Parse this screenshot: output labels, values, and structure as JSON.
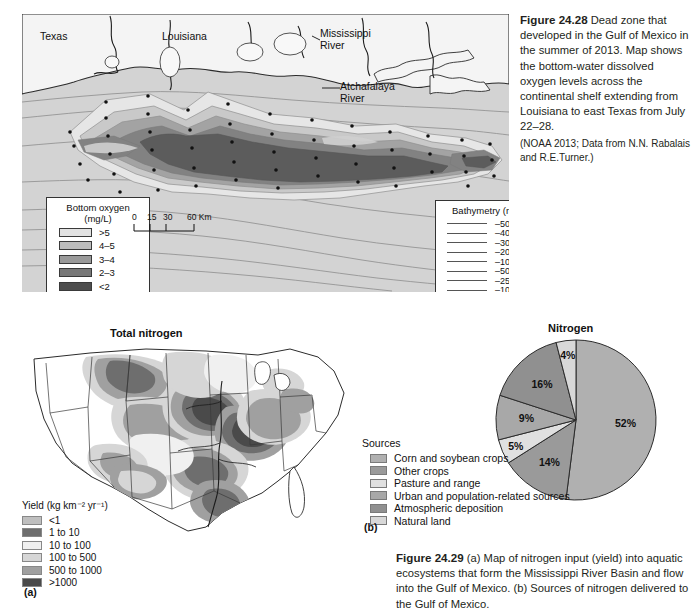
{
  "figure_2428": {
    "caption_number": "Figure 24.28",
    "caption_text": "Dead zone that developed in the Gulf of Mexico in the summer of 2013. Map shows the bottom-water dissolved oxygen levels across the continental shelf extending from Louisiana to east Texas from July 22–28.",
    "source": "(NOAA 2013; Data from N.N. Rabalais and R.E.Turner.)",
    "map_labels": {
      "texas": "Texas",
      "louisiana": "Louisiana",
      "mississippi_river": "Mississippi\nRiver",
      "atchafalaya_river": "Atchafalaya\nRiver"
    },
    "scale_bar": {
      "ticks": [
        "0",
        "15",
        "30",
        "60 Km"
      ]
    },
    "oxygen_legend": {
      "title_line1": "Bottom oxygen",
      "title_line2": "(mg/L)",
      "items": [
        {
          "label": ">5",
          "color": "#e2e2e2"
        },
        {
          "label": "4–5",
          "color": "#bdbdbd"
        },
        {
          "label": "3–4",
          "color": "#9a9a9a"
        },
        {
          "label": "2–3",
          "color": "#787878"
        },
        {
          "label": "<2",
          "color": "#4e4e4e"
        }
      ]
    },
    "bathymetry_legend": {
      "title": "Bathymetry (m)",
      "items": [
        "–500",
        "–400",
        "–300",
        "–200",
        "–100",
        "–50",
        "–25",
        "–10"
      ]
    }
  },
  "figure_2429": {
    "caption_number": "Figure 24.29",
    "caption_text": "(a) Map of nitrogen input (yield) into aquatic ecosystems that form the Mississippi River Basin and flow into the Gulf of Mexico. (b) Sources of nitrogen delivered to the Gulf of Mexico.",
    "source": "(United States Geological Survey.)",
    "panel_a_label": "(a)",
    "panel_b_label": "(b)",
    "us_map": {
      "title": "Total nitrogen",
      "legend_title": "Yield (kg km⁻² yr⁻¹)",
      "legend_items": [
        {
          "label": "<1",
          "color": "#bfbfbf"
        },
        {
          "label": "1 to 10",
          "color": "#6e6e6e"
        },
        {
          "label": "10 to 100",
          "color": "#f0f0f0"
        },
        {
          "label": "100 to 500",
          "color": "#d6d6d6"
        },
        {
          "label": "500 to 1000",
          "color": "#a0a0a0"
        },
        {
          "label": ">1000",
          "color": "#4a4a4a"
        }
      ]
    },
    "pie": {
      "title": "Nitrogen",
      "legend_title": "Sources"
    }
  },
  "chart_data": {
    "type": "pie",
    "title": "Nitrogen",
    "legend_title": "Sources",
    "legend_position": "left",
    "unit": "percent",
    "categories": [
      "Corn and soybean crops",
      "Other crops",
      "Pasture and range",
      "Urban and population-related sources",
      "Atmospheric deposition",
      "Natural land"
    ],
    "values": [
      52,
      14,
      5,
      9,
      16,
      4
    ],
    "labels": [
      "52%",
      "14%",
      "5%",
      "9%",
      "16%",
      "4%"
    ],
    "colors": [
      "#b0b0b0",
      "#9a9a9a",
      "#e0e0e0",
      "#a8a8a8",
      "#909090",
      "#d8d8d8"
    ]
  }
}
